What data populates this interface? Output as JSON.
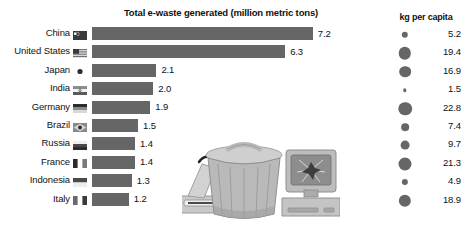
{
  "chart_data": {
    "type": "bar",
    "title": "Total e-waste generated (million metric tons)",
    "xlabel": "",
    "ylabel": "",
    "xlim": [
      0,
      7.6
    ],
    "grid": false,
    "categories": [
      "China",
      "United States",
      "Japan",
      "India",
      "Germany",
      "Brazil",
      "Russia",
      "France",
      "Indonesia",
      "Italy"
    ],
    "values": [
      7.2,
      6.3,
      2.1,
      2.0,
      1.9,
      1.5,
      1.4,
      1.4,
      1.3,
      1.2
    ],
    "value_labels": [
      "7.2",
      "6.3",
      "2.1",
      "2.0",
      "1.9",
      "1.5",
      "1.4",
      "1.4",
      "1.3",
      "1.2"
    ],
    "series": [
      {
        "name": "Total e-waste generated (million metric tons)",
        "values": [
          7.2,
          6.3,
          2.1,
          2.0,
          1.9,
          1.5,
          1.4,
          1.4,
          1.3,
          1.2
        ]
      },
      {
        "name": "kg per capita",
        "type": "bubble",
        "values": [
          5.2,
          19.4,
          16.9,
          1.5,
          22.8,
          7.4,
          9.7,
          21.3,
          4.9,
          18.9
        ]
      }
    ],
    "legend": {
      "title": "kg per capita",
      "position": "right",
      "entries": [
        {
          "category": "China",
          "value": 5.2,
          "label": "5.2"
        },
        {
          "category": "United States",
          "value": 19.4,
          "label": "19.4"
        },
        {
          "category": "Japan",
          "value": 16.9,
          "label": "16.9"
        },
        {
          "category": "India",
          "value": 1.5,
          "label": "1.5"
        },
        {
          "category": "Germany",
          "value": 22.8,
          "label": "22.8"
        },
        {
          "category": "Brazil",
          "value": 7.4,
          "label": "7.4"
        },
        {
          "category": "Russia",
          "value": 9.7,
          "label": "9.7"
        },
        {
          "category": "France",
          "value": 21.3,
          "label": "21.3"
        },
        {
          "category": "Indonesia",
          "value": 4.9,
          "label": "4.9"
        },
        {
          "category": "Italy",
          "value": 18.9,
          "label": "18.9"
        }
      ]
    }
  },
  "colors": {
    "bar": "#666666",
    "bubble": "#666666",
    "text": "#111111",
    "background": "#ffffff"
  },
  "rows": [
    {
      "country": "China",
      "flag": "flag-china-icon",
      "value": "7.2",
      "capita": "5.2"
    },
    {
      "country": "United States",
      "flag": "flag-united-states-icon",
      "value": "6.3",
      "capita": "19.4"
    },
    {
      "country": "Japan",
      "flag": "flag-japan-icon",
      "value": "2.1",
      "capita": "16.9"
    },
    {
      "country": "India",
      "flag": "flag-india-icon",
      "value": "2.0",
      "capita": "1.5"
    },
    {
      "country": "Germany",
      "flag": "flag-germany-icon",
      "value": "1.9",
      "capita": "22.8"
    },
    {
      "country": "Brazil",
      "flag": "flag-brazil-icon",
      "value": "1.5",
      "capita": "7.4"
    },
    {
      "country": "Russia",
      "flag": "flag-russia-icon",
      "value": "1.4",
      "capita": "9.7"
    },
    {
      "country": "France",
      "flag": "flag-france-icon",
      "value": "1.4",
      "capita": "21.3"
    },
    {
      "country": "Indonesia",
      "flag": "flag-indonesia-icon",
      "value": "1.3",
      "capita": "4.9"
    },
    {
      "country": "Italy",
      "flag": "flag-italy-icon",
      "value": "1.2",
      "capita": "18.9"
    }
  ],
  "legend_title": "kg per capita",
  "illustration": {
    "name": "e-waste-illustration",
    "parts": [
      "trash-can-icon",
      "crt-monitor-icon",
      "computer-tower-icon",
      "printer-icon"
    ]
  }
}
